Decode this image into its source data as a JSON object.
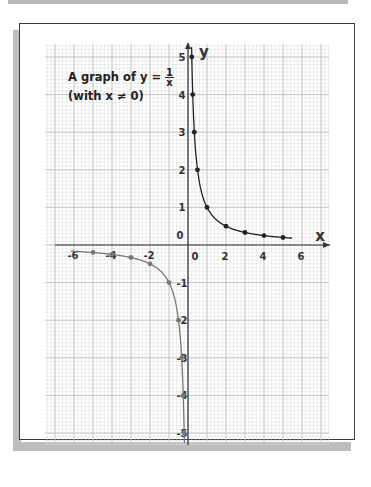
{
  "chart_data": {
    "type": "line",
    "subtitle": "(with x ≠ 0)",
    "title_parts": {
      "prefix": "A graph of y =",
      "numerator": "1",
      "denominator": "x",
      "subtitle": "(with x ≠ 0)"
    },
    "xlabel": "x",
    "ylabel": "y",
    "xlim": [
      -7,
      7
    ],
    "ylim": [
      -5.5,
      5.5
    ],
    "grid": true,
    "x_tick_labels": [
      "-6",
      "-4",
      "-2",
      "0",
      "2",
      "4",
      "6"
    ],
    "y_tick_labels": [
      "5",
      "4",
      "3",
      "2",
      "1",
      "0",
      "-1",
      "-2",
      "-3",
      "-4",
      "-5"
    ],
    "series": [
      {
        "name": "positive branch",
        "color": "#222222",
        "x": [
          0.2,
          0.25,
          0.333,
          0.5,
          1,
          2,
          3,
          4,
          5
        ],
        "y": [
          5,
          4,
          3,
          2,
          1,
          0.5,
          0.333,
          0.25,
          0.2
        ]
      },
      {
        "name": "negative branch",
        "color": "#777777",
        "x": [
          -5,
          -4,
          -3,
          -2,
          -1,
          -0.5,
          -0.333,
          -0.25,
          -0.2
        ],
        "y": [
          -0.2,
          -0.25,
          -0.333,
          -0.5,
          -1,
          -2,
          -3,
          -4,
          -5
        ]
      }
    ]
  }
}
